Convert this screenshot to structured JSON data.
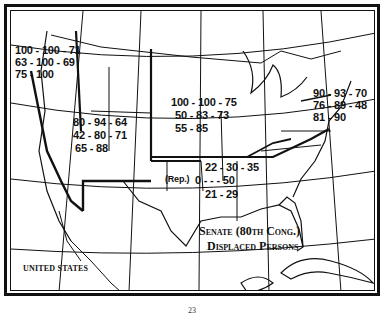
{
  "map": {
    "title_line1": "Senate (80th Cong.)",
    "title_line2": "Displaced Persons",
    "country_label": "United States",
    "page_number": "23"
  },
  "regions": {
    "pacific": {
      "lines": [
        "100 - 100 - 71",
        "63 - 100 - 69",
        "75 - 100"
      ]
    },
    "mountain": {
      "lines": [
        "80 - 94 - 64",
        "42 - 80 - 71",
        "65 - 88"
      ]
    },
    "midwest": {
      "lines": [
        "100 - 100 - 75",
        "50 - 83 - 73",
        "55 - 85"
      ]
    },
    "northeast": {
      "lines": [
        "90 - 93 - 70",
        "76 - 89 - 48",
        "81 - 90"
      ]
    },
    "south": {
      "lines": [
        "22 - 30 - 35",
        "0 - - - 50",
        "21 - 29"
      ],
      "note": "(Rep.)"
    }
  },
  "colors": {
    "ink": "#111111",
    "paper": "#ffffff"
  }
}
